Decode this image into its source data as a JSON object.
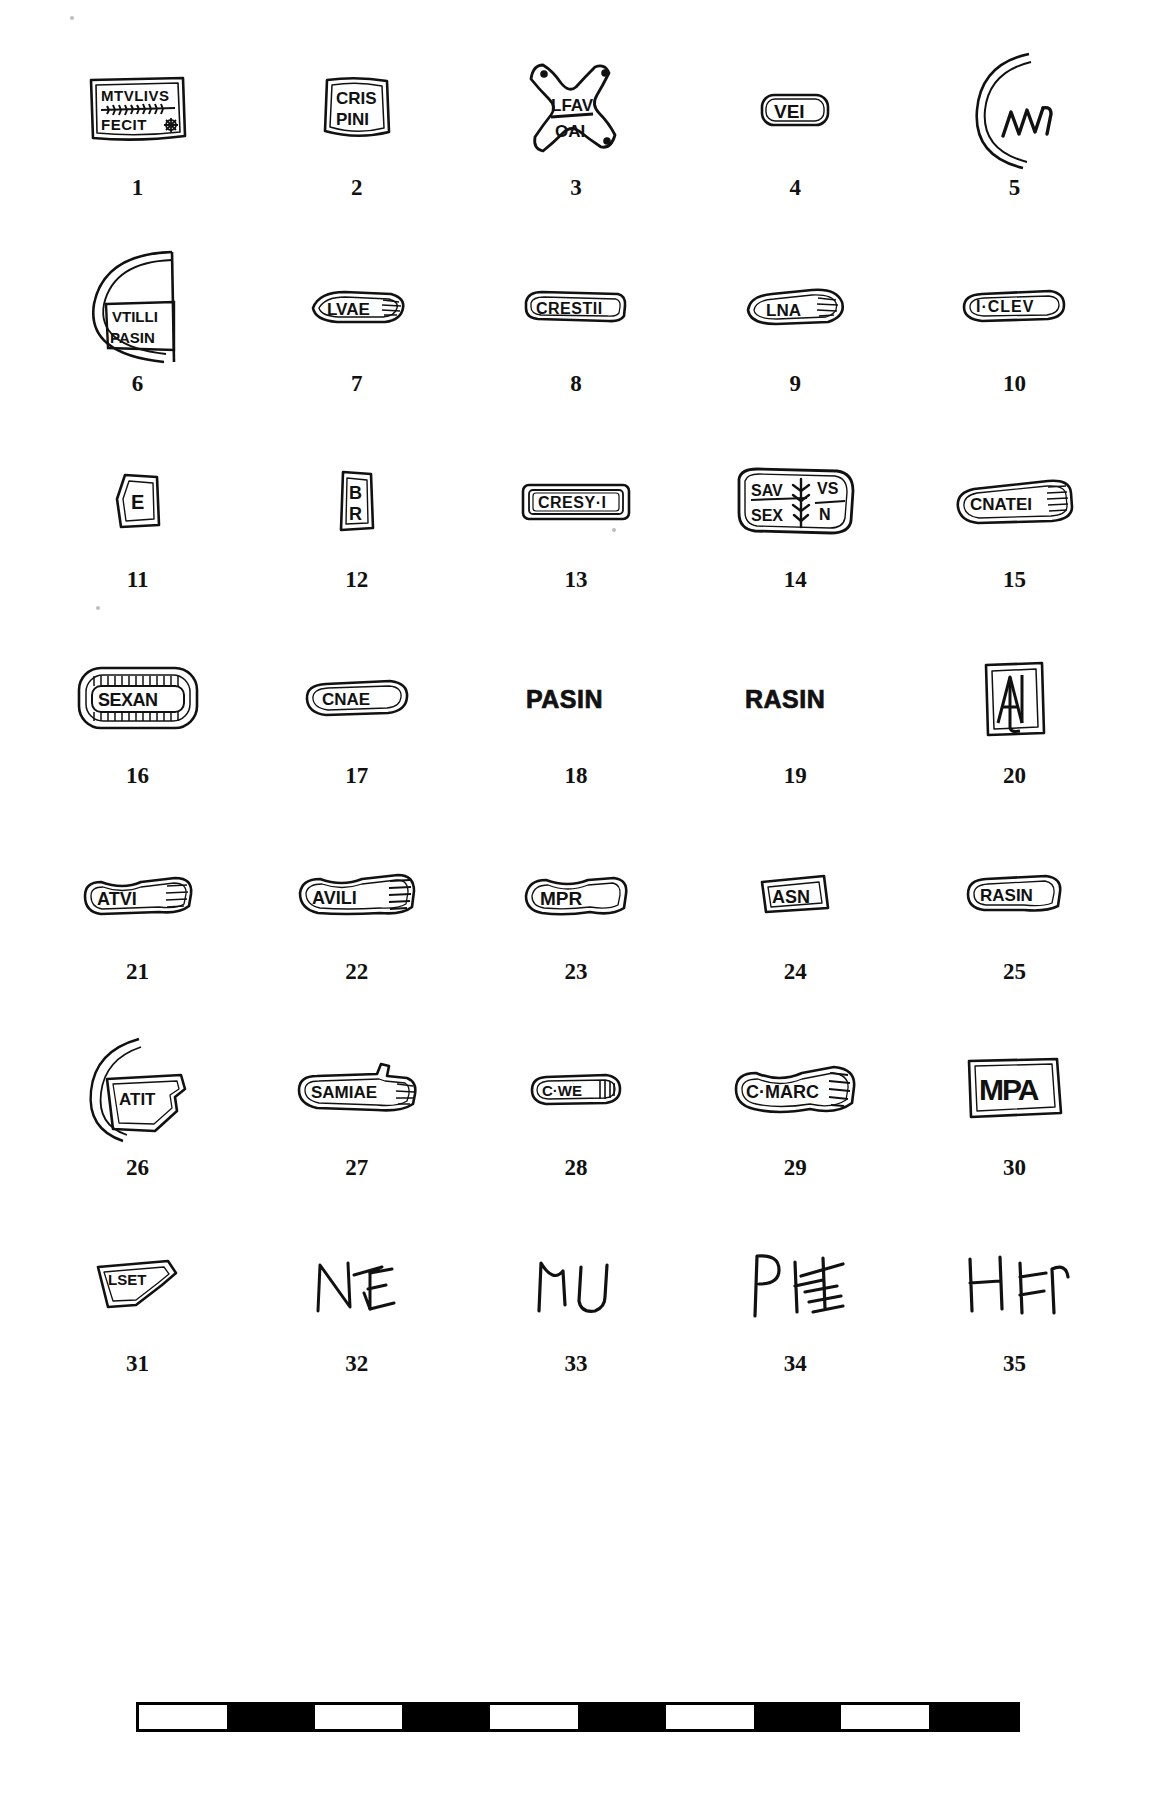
{
  "plate": {
    "title": "Plate of stamped pottery and brick stamps",
    "item_count": 35,
    "columns": 5,
    "rows": 7,
    "ink_color": "#111111",
    "background_color": "#ffffff"
  },
  "items": [
    {
      "number": "1",
      "inscription": "MTVLIVS FECIT",
      "lines": [
        "MTVLIVS",
        "FECIT"
      ],
      "shape": "rectangular-tablet",
      "ornament": "palm-branch-and-rosette",
      "notes": "two lines separated by a palm branch, rosette after FECIT"
    },
    {
      "number": "2",
      "inscription": "CRISPINI",
      "lines": [
        "CRIS",
        "PINI"
      ],
      "shape": "square-tablet",
      "ornament": "none"
    },
    {
      "number": "3",
      "inscription": "LFAV OAI",
      "lines": [
        "LFAV",
        "OAI"
      ],
      "shape": "four-pointed-star",
      "ornament": "four-corner-dots"
    },
    {
      "number": "4",
      "inscription": "VEI",
      "lines": [
        "VEI"
      ],
      "shape": "rounded-rectangle",
      "ornament": "none"
    },
    {
      "number": "5",
      "inscription": "MVC",
      "lines": [
        "MVC"
      ],
      "shape": "arc-fragment",
      "ornament": "curved-sherd-edge"
    },
    {
      "number": "6",
      "inscription": "VTILLI PASIN",
      "lines": [
        "VTILLI",
        "PASIN"
      ],
      "shape": "disc-fragment",
      "ornament": "circular-sherd-outline"
    },
    {
      "number": "7",
      "inscription": "LVAE",
      "lines": [
        "LVAE"
      ],
      "shape": "lens-cartouche",
      "ornament": "hatched-end"
    },
    {
      "number": "8",
      "inscription": "CRESTII",
      "lines": [
        "CRESTII"
      ],
      "shape": "rounded-bar",
      "ornament": "none"
    },
    {
      "number": "9",
      "inscription": "LNA",
      "lines": [
        "LNA"
      ],
      "shape": "lens-cartouche",
      "ornament": "hatched-end"
    },
    {
      "number": "10",
      "inscription": "I·CLEV",
      "lines": [
        "I·CLEV"
      ],
      "shape": "lens-cartouche",
      "ornament": "none"
    },
    {
      "number": "11",
      "inscription": "E",
      "lines": [
        "E"
      ],
      "shape": "irregular-sherd",
      "ornament": "none"
    },
    {
      "number": "12",
      "inscription": "BR",
      "lines": [
        "B",
        "R"
      ],
      "shape": "narrow-tablet",
      "ornament": "none"
    },
    {
      "number": "13",
      "inscription": "CRESY·I",
      "lines": [
        "CRESY·I"
      ],
      "shape": "double-framed-rectangle",
      "ornament": "double-border"
    },
    {
      "number": "14",
      "inscription": "SAV VS SEX N",
      "lines": [
        "SAV VS",
        "SEX N"
      ],
      "shape": "rectangular-tablet",
      "ornament": "palm-branch-centre"
    },
    {
      "number": "15",
      "inscription": "CNATEI",
      "lines": [
        "CNATEI"
      ],
      "shape": "rounded-bar",
      "ornament": "hatched-end"
    },
    {
      "number": "16",
      "inscription": "SEXAN",
      "lines": [
        "SEXAN"
      ],
      "shape": "rounded-rectangle",
      "ornament": "ribbed-top-and-bottom-border"
    },
    {
      "number": "17",
      "inscription": "CNAE",
      "lines": [
        "CNAE"
      ],
      "shape": "rounded-bar",
      "ornament": "none"
    },
    {
      "number": "18",
      "inscription": "PASIN",
      "lines": [
        "PASIN"
      ],
      "shape": "letters-only",
      "ornament": "none"
    },
    {
      "number": "19",
      "inscription": "RASIN",
      "lines": [
        "RASIN"
      ],
      "shape": "letters-only",
      "ornament": "none"
    },
    {
      "number": "20",
      "inscription": "AN",
      "lines": [
        "AN"
      ],
      "shape": "square-frame",
      "ornament": "ligature-AN"
    },
    {
      "number": "21",
      "inscription": "ATVI",
      "lines": [
        "ATVI"
      ],
      "shape": "wavy-bar",
      "ornament": "hatched-end"
    },
    {
      "number": "22",
      "inscription": "AVILI",
      "lines": [
        "AVILI"
      ],
      "shape": "wavy-bar",
      "ornament": "hatched-end"
    },
    {
      "number": "23",
      "inscription": "MPR",
      "lines": [
        "MPR"
      ],
      "shape": "wavy-bar",
      "ornament": "none"
    },
    {
      "number": "24",
      "inscription": "ASN",
      "lines": [
        "ASN"
      ],
      "shape": "small-tablet",
      "ornament": "none"
    },
    {
      "number": "25",
      "inscription": "RASIN",
      "lines": [
        "RASIN"
      ],
      "shape": "rounded-bar",
      "ornament": "none"
    },
    {
      "number": "26",
      "inscription": "ATIT",
      "lines": [
        "ATIT"
      ],
      "shape": "sherd-with-arc",
      "ornament": "curved-sherd-edge"
    },
    {
      "number": "27",
      "inscription": "SAMIAE",
      "lines": [
        "SAMIAE"
      ],
      "shape": "irregular-bar",
      "ornament": "hatched-end"
    },
    {
      "number": "28",
      "inscription": "C·WE",
      "lines": [
        "C·WE"
      ],
      "shape": "lens-cartouche",
      "ornament": "hatched-end"
    },
    {
      "number": "29",
      "inscription": "C·MARC",
      "lines": [
        "C·MARC"
      ],
      "shape": "wavy-bar",
      "ornament": "hatched-end"
    },
    {
      "number": "30",
      "inscription": "MPA",
      "lines": [
        "MPA"
      ],
      "shape": "rectangular-tablet",
      "ornament": "none"
    },
    {
      "number": "31",
      "inscription": "LSET",
      "lines": [
        "LSET"
      ],
      "shape": "triangular-sherd",
      "ornament": "none"
    },
    {
      "number": "32",
      "inscription": "NVE",
      "lines": [
        "NVE"
      ],
      "shape": "letters-only",
      "ornament": "graffito"
    },
    {
      "number": "33",
      "inscription": "MN",
      "lines": [
        "MN"
      ],
      "shape": "letters-only",
      "ornament": "graffito"
    },
    {
      "number": "34",
      "inscription": "PHE",
      "lines": [
        "PHE"
      ],
      "shape": "letters-only",
      "ornament": "graffito-with-strokes"
    },
    {
      "number": "35",
      "inscription": "HER",
      "lines": [
        "HER"
      ],
      "shape": "letters-only",
      "ornament": "graffito"
    }
  ],
  "scale_bar": {
    "segments": 10,
    "pattern": [
      "dark",
      "light",
      "dark",
      "light",
      "dark",
      "light",
      "dark",
      "light",
      "dark",
      "light"
    ],
    "dark_color": "#000000",
    "light_color": "#ffffff"
  }
}
